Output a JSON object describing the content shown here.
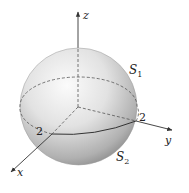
{
  "figure": {
    "type": "sphere-surface-diagram",
    "labels": {
      "z_axis": "z",
      "y_axis": "y",
      "x_axis": "x",
      "upper_surface": "S",
      "upper_surface_sub": "1",
      "lower_surface": "S",
      "lower_surface_sub": "2",
      "x_intercept": "2",
      "y_intercept": "2"
    },
    "colors": {
      "axis": "#333333",
      "dashed": "#555555",
      "sphere_light": "#f7f7f7",
      "sphere_dark": "#8a8a8a"
    }
  }
}
